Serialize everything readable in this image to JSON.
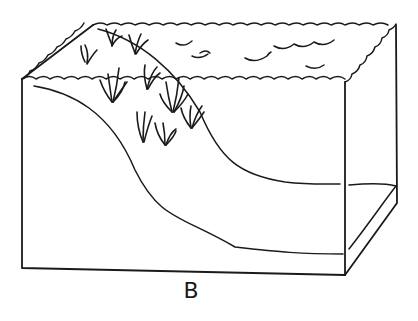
{
  "figure": {
    "label": "B",
    "colors": {
      "line": "#1a1a1a",
      "background": "#ffffff"
    }
  }
}
